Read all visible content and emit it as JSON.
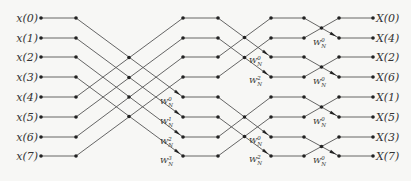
{
  "diagram": {
    "inputs": [
      "x(0)",
      "x(1)",
      "x(2)",
      "x(3)",
      "x(4)",
      "x(5)",
      "x(6)",
      "x(7)"
    ],
    "outputs": [
      "X(0)",
      "X(4)",
      "X(2)",
      "X(6)",
      "X(1)",
      "X(5)",
      "X(3)",
      "X(7)"
    ],
    "twiddle_base": "W",
    "twiddle_sub": "N",
    "stage1_twiddles": [
      "0",
      "1",
      "2",
      "3"
    ],
    "stage2_twiddles": [
      "0",
      "2",
      "0",
      "2"
    ],
    "stage3_twiddles": [
      "0",
      "0",
      "0",
      "0"
    ],
    "colors": {
      "line": "#555555",
      "node": "#222222",
      "background": "#f7f7f5"
    }
  }
}
